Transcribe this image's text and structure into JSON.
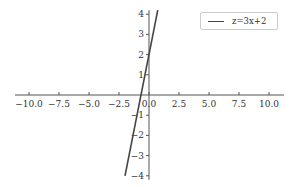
{
  "chart_data": {
    "type": "line",
    "title": "",
    "xlabel": "",
    "ylabel": "",
    "xlim": [
      -11,
      11
    ],
    "ylim": [
      -4.2,
      4.2
    ],
    "grid": false,
    "legend_position": "upper right",
    "x_ticks": [
      "-10.0",
      "-7.5",
      "-5.0",
      "-2.5",
      "0.0",
      "2.5",
      "5.0",
      "7.5",
      "10.0"
    ],
    "y_ticks": [
      "-4",
      "-3",
      "-2",
      "-1",
      "1",
      "2",
      "3",
      "4"
    ],
    "series": [
      {
        "name": "z=3x+2",
        "x": [
          -2,
          0.73
        ],
        "y": [
          -4,
          4.2
        ],
        "color": "#444444"
      }
    ]
  },
  "legend": {
    "label": "z=3x+2"
  }
}
